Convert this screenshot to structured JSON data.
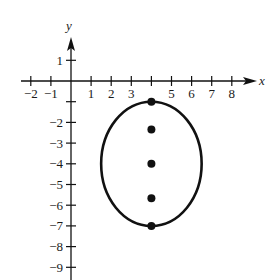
{
  "chart_data": {
    "type": "scatter",
    "title": "",
    "xlabel": "x",
    "ylabel": "y",
    "xlim": [
      -2,
      8
    ],
    "ylim": [
      -9,
      1
    ],
    "grid": false,
    "x_ticks": [
      -2,
      -1,
      1,
      2,
      3,
      5,
      6,
      7,
      8
    ],
    "x_tick_marks": [
      -2,
      -1,
      1,
      2,
      3,
      4,
      5,
      6,
      7,
      8
    ],
    "y_ticks": [
      1,
      -2,
      -3,
      -4,
      -5,
      -6,
      -7,
      -8,
      -9
    ],
    "y_tick_marks": [
      1,
      -1,
      -2,
      -3,
      -4,
      -5,
      -6,
      -7,
      -8,
      -9
    ],
    "ellipse": {
      "center": [
        4,
        -4
      ],
      "semi_axis_x": 2.5,
      "semi_axis_y": 3,
      "equation": "(x-4)^2/6.25 + (y+4)^2/9 = 1"
    },
    "points": [
      {
        "label": "vertex",
        "x": 4,
        "y": -1
      },
      {
        "label": "focus",
        "x": 4,
        "y": -2.34
      },
      {
        "label": "center",
        "x": 4,
        "y": -4
      },
      {
        "label": "focus",
        "x": 4,
        "y": -5.66
      },
      {
        "label": "vertex",
        "x": 4,
        "y": -7
      }
    ]
  },
  "colors": {
    "ink": "#111111",
    "background": "#ffffff"
  }
}
